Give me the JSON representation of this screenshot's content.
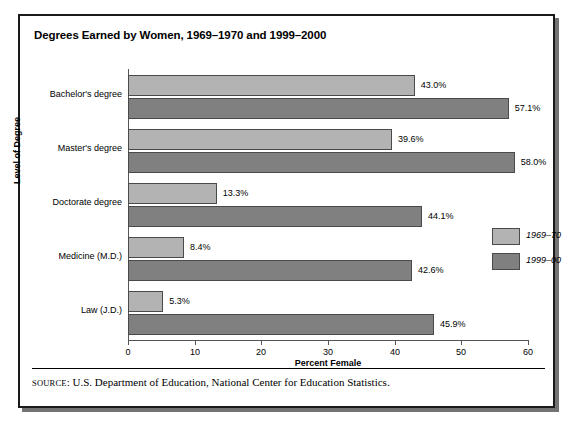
{
  "chart_data": {
    "type": "bar",
    "orientation": "horizontal",
    "title": "Degrees Earned by Women, 1969–1970 and 1999–2000",
    "xlabel": "Percent Female",
    "ylabel": "Level of Degree",
    "xlim": [
      0,
      60
    ],
    "xticks": [
      0,
      10,
      20,
      30,
      40,
      50,
      60
    ],
    "xtick_labels": [
      "0",
      "10",
      "20",
      "30",
      "40",
      "50",
      "60"
    ],
    "grid": false,
    "legend_position": "right",
    "categories": [
      "Bachelor's degree",
      "Master's degree",
      "Doctorate degree",
      "Medicine (M.D.)",
      "Law (J.D.)"
    ],
    "series": [
      {
        "name": "1969–70",
        "color": "#b3b3b3",
        "values": [
          43.0,
          39.6,
          13.3,
          8.4,
          5.3
        ],
        "labels": [
          "43.0%",
          "39.6%",
          "13.3%",
          "8.4%",
          "5.3%"
        ]
      },
      {
        "name": "1999–00",
        "color": "#808080",
        "values": [
          57.1,
          58.0,
          44.1,
          42.6,
          45.9
        ],
        "labels": [
          "57.1%",
          "58.0%",
          "44.1%",
          "42.6%",
          "45.9%"
        ]
      }
    ],
    "source_prefix": "SOURCE",
    "source_text": ": U.S. Department of Education, National Center for Education Statistics."
  }
}
